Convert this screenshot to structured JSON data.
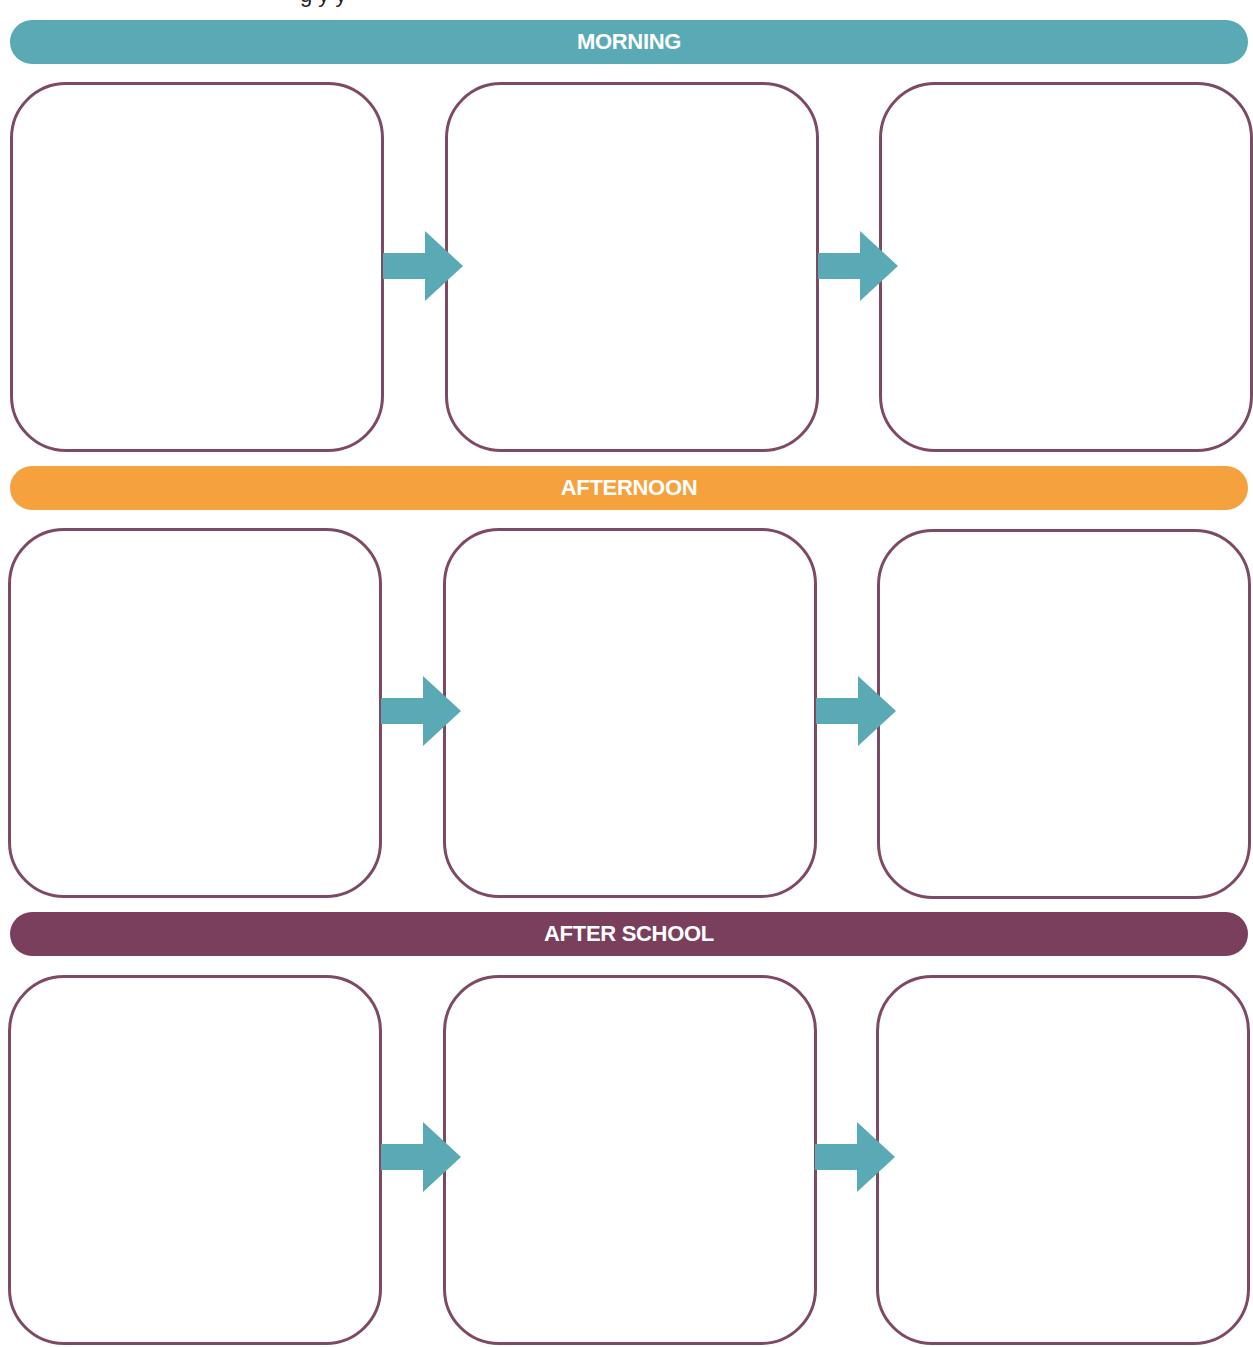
{
  "header": {
    "partial_title": "g   y   y"
  },
  "colors": {
    "morning": "#5aaab5",
    "afternoon": "#f5a13e",
    "after_school": "#7b3f5e",
    "box_border": "#7e4a63",
    "arrow": "#5aaab5"
  },
  "sections": [
    {
      "label": "MORNING",
      "boxes": [
        "",
        "",
        ""
      ]
    },
    {
      "label": "AFTERNOON",
      "boxes": [
        "",
        "",
        ""
      ]
    },
    {
      "label": "AFTER SCHOOL",
      "boxes": [
        "",
        "",
        ""
      ]
    }
  ]
}
